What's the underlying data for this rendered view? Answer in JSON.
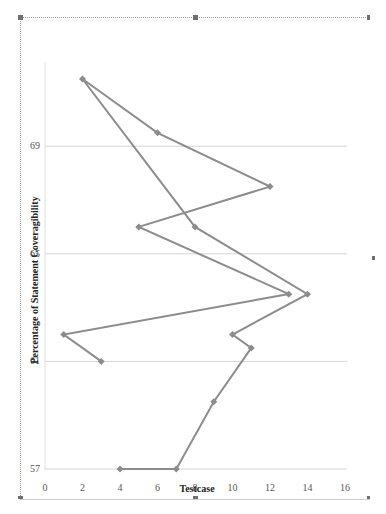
{
  "chart_data": {
    "type": "scatter",
    "subtype": "scatter-with-straight-lines-and-markers",
    "title": "",
    "xlabel": "Testcase",
    "ylabel": "Percentage of Statement Coveragibility",
    "xlim": [
      0,
      16
    ],
    "ylim": [
      57,
      72
    ],
    "x_ticks": [
      0,
      2,
      4,
      6,
      8,
      10,
      12,
      14,
      16
    ],
    "y_ticks": [
      57,
      61,
      65,
      69
    ],
    "grid": "horizontal",
    "legend": "none",
    "series": [
      {
        "name": "Statement Coveragibility",
        "color": "#8c8c8c",
        "marker": "diamond",
        "points": [
          {
            "x": 4,
            "y": 57
          },
          {
            "x": 7,
            "y": 57
          },
          {
            "x": 9,
            "y": 59.5
          },
          {
            "x": 11,
            "y": 61.5
          },
          {
            "x": 10,
            "y": 62
          },
          {
            "x": 14,
            "y": 63.5
          },
          {
            "x": 8,
            "y": 66
          },
          {
            "x": 2,
            "y": 71.5
          },
          {
            "x": 6,
            "y": 69.5
          },
          {
            "x": 12,
            "y": 67.5
          },
          {
            "x": 5,
            "y": 66
          },
          {
            "x": 13,
            "y": 63.5
          },
          {
            "x": 1,
            "y": 62
          },
          {
            "x": 3,
            "y": 61
          }
        ]
      }
    ]
  },
  "colors": {
    "line": "#8c8c8c",
    "grid": "#d4d4d4",
    "axis": "#bdbdbd",
    "frame": "#9a9a9a"
  }
}
